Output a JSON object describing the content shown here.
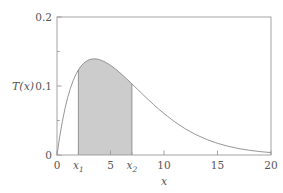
{
  "chart_data": {
    "type": "line",
    "title": "",
    "subtitle": "",
    "xlabel": "x",
    "ylabel": "T(x)",
    "xlim": [
      0,
      20
    ],
    "ylim": [
      0,
      0.2
    ],
    "grid": false,
    "legend": null,
    "x_major_ticks": [
      0,
      5,
      10,
      15,
      20
    ],
    "x_major_tick_labels": [
      "0",
      "5",
      "10",
      "15",
      "20"
    ],
    "x_special_ticks": [
      2.0,
      7.0
    ],
    "x_special_tick_labels": [
      "x1",
      "x2"
    ],
    "y_major_ticks": [
      0,
      0.1,
      0.2
    ],
    "y_major_tick_labels": [
      "0",
      "0.1",
      "0.2"
    ],
    "y_minor_ticks": [
      0.05,
      0.15
    ],
    "curve_color": "#808080",
    "fill_color": "#cccccc",
    "frame_color": "#999999",
    "shaded_region": {
      "label": "area between x1 and x2",
      "x_start": 2.0,
      "x_end": 7.0
    },
    "x": [
      0.0,
      0.25,
      0.5,
      0.75,
      1.0,
      1.25,
      1.5,
      1.75,
      2.0,
      2.25,
      2.5,
      2.75,
      3.0,
      3.25,
      3.5,
      3.75,
      4.0,
      4.5,
      5.0,
      5.5,
      6.0,
      6.5,
      7.0,
      7.5,
      8.0,
      8.5,
      9.0,
      9.5,
      10.0,
      11.0,
      12.0,
      13.0,
      14.0,
      15.0,
      16.0,
      17.0,
      18.0,
      19.0,
      20.0
    ],
    "y": [
      0.0,
      0.0263,
      0.0486,
      0.0675,
      0.0834,
      0.0966,
      0.1075,
      0.1163,
      0.1234,
      0.1289,
      0.133,
      0.136,
      0.138,
      0.1391,
      0.1394,
      0.139,
      0.1381,
      0.1348,
      0.13,
      0.1242,
      0.1176,
      0.1105,
      0.1031,
      0.0956,
      0.0881,
      0.0807,
      0.0735,
      0.0666,
      0.0601,
      0.0481,
      0.0378,
      0.0293,
      0.0224,
      0.0169,
      0.0126,
      0.0093,
      0.0068,
      0.0049,
      0.0035
    ],
    "peak": {
      "x": 3.5,
      "y": 0.1394
    }
  },
  "labels": {
    "y_top": "0.2",
    "y_mid": "0.1",
    "y_zero": "0",
    "y_axis_title": "T(x)",
    "x_zero": "0",
    "x_one_main": "x",
    "x_one_sub": "1",
    "x_five": "5",
    "x_two_main": "x",
    "x_two_sub": "2",
    "x_ten": "10",
    "x_fifteen": "15",
    "x_twenty": "20",
    "x_axis_title": "x"
  }
}
